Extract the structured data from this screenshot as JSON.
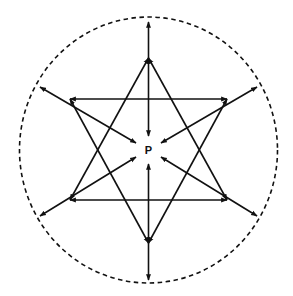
{
  "diagram": {
    "center_label": "P",
    "center": [
      148.5,
      150
    ],
    "stroke_color": "#111111",
    "boundary": {
      "style": "dashed",
      "shape": "circle",
      "rx": 129,
      "ry": 133
    },
    "radial_arrows": [
      {
        "angle_deg": 90,
        "outer": [
          148.5,
          22
        ],
        "inner": [
          148.5,
          136
        ]
      },
      {
        "angle_deg": 270,
        "outer": [
          148.5,
          280
        ],
        "inner": [
          148.5,
          164
        ]
      },
      {
        "angle_deg": 150,
        "outer": [
          40,
          87
        ],
        "inner": [
          136,
          143
        ]
      },
      {
        "angle_deg": 30,
        "outer": [
          257,
          87
        ],
        "inner": [
          161,
          143
        ]
      },
      {
        "angle_deg": 210,
        "outer": [
          40,
          216
        ],
        "inner": [
          136,
          157
        ]
      },
      {
        "angle_deg": 330,
        "outer": [
          257,
          216
        ],
        "inner": [
          161,
          157
        ]
      }
    ],
    "triangles": [
      {
        "name": "upward-triangle",
        "vertices": [
          [
            148.5,
            58
          ],
          [
            70,
            200
          ],
          [
            227,
            200
          ]
        ]
      },
      {
        "name": "downward-triangle",
        "vertices": [
          [
            70,
            99
          ],
          [
            227,
            99
          ],
          [
            148.5,
            243
          ]
        ]
      }
    ]
  }
}
